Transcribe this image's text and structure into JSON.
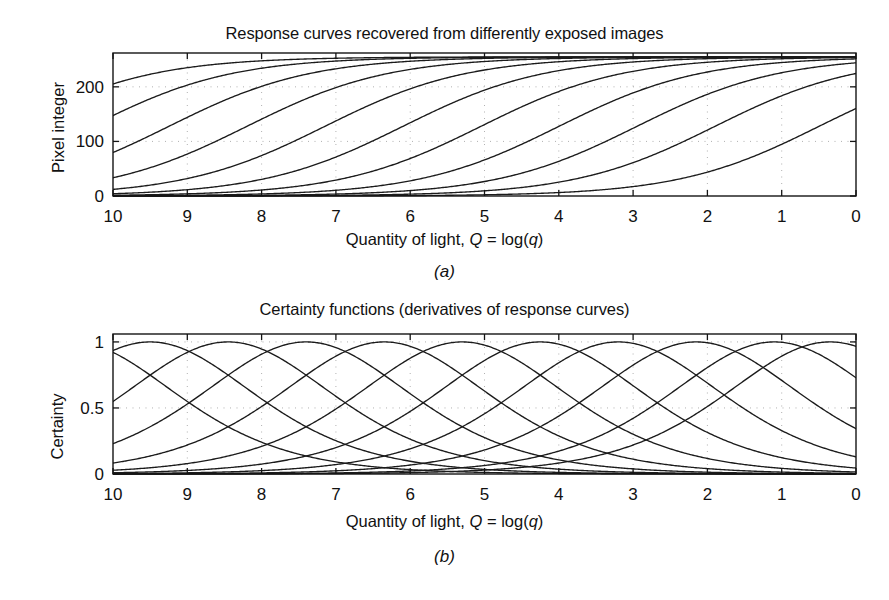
{
  "figure": {
    "caption_a": "(a)",
    "caption_b": "(b)"
  },
  "panel_a": {
    "title": "Response curves recovered from differently exposed images",
    "xlabel_prefix": "Quantity of light, ",
    "xlabel_var1": "Q",
    "xlabel_mid": " = log(",
    "xlabel_var2": "q",
    "xlabel_suffix": ")",
    "ylabel": "Pixel integer"
  },
  "panel_b": {
    "title": "Certainty functions (derivatives of response curves)",
    "xlabel_prefix": "Quantity of light, ",
    "xlabel_var1": "Q",
    "xlabel_mid": " = log(",
    "xlabel_var2": "q",
    "xlabel_suffix": ")",
    "ylabel": "Certainty"
  },
  "chart_data": [
    {
      "type": "line",
      "id": "response-curves",
      "title": "Response curves recovered from differently exposed images",
      "xlabel": "Quantity of light, Q = log(q)",
      "ylabel": "Pixel integer",
      "xlim": [
        10,
        0
      ],
      "ylim": [
        0,
        262
      ],
      "x_ticks": [
        10,
        9,
        8,
        7,
        6,
        5,
        4,
        3,
        2,
        1,
        0
      ],
      "y_ticks": [
        0,
        100,
        200
      ],
      "y_tick_labels": [
        "0",
        "100",
        "200"
      ],
      "x_reversed": true,
      "grid": "dotted",
      "legend": "none",
      "curve_count": 11,
      "curve_model": "f(Q) = 255 / (1 + exp(k*(Q - Q0)))",
      "curve_slope_k": 1.05,
      "curve_centers_Q0": [
        11.35,
        10.3,
        9.25,
        8.2,
        7.15,
        6.1,
        5.05,
        4.0,
        2.95,
        1.9,
        0.5
      ],
      "series": [
        {
          "name": "exposure-1",
          "center_Q": 11.35,
          "left_edge_value": 255,
          "right_edge_value": 255
        },
        {
          "name": "exposure-2",
          "center_Q": 10.3,
          "left_edge_value": 236,
          "right_edge_value": 255
        },
        {
          "name": "exposure-3",
          "center_Q": 9.25,
          "left_edge_value": 140,
          "right_edge_value": 255
        },
        {
          "name": "exposure-4",
          "center_Q": 8.2,
          "left_edge_value": 65,
          "right_edge_value": 255
        },
        {
          "name": "exposure-5",
          "center_Q": 7.15,
          "left_edge_value": 25,
          "right_edge_value": 255
        },
        {
          "name": "exposure-6",
          "center_Q": 6.1,
          "left_edge_value": 9,
          "right_edge_value": 255
        },
        {
          "name": "exposure-7",
          "center_Q": 5.05,
          "left_edge_value": 3,
          "right_edge_value": 254
        },
        {
          "name": "exposure-8",
          "center_Q": 4.0,
          "left_edge_value": 1,
          "right_edge_value": 251
        },
        {
          "name": "exposure-9",
          "center_Q": 2.95,
          "left_edge_value": 0,
          "right_edge_value": 240
        },
        {
          "name": "exposure-10",
          "center_Q": 1.9,
          "left_edge_value": 0,
          "right_edge_value": 218
        },
        {
          "name": "exposure-11",
          "center_Q": 0.5,
          "left_edge_value": 0,
          "right_edge_value": 237
        }
      ]
    },
    {
      "type": "line",
      "id": "certainty-functions",
      "title": "Certainty functions (derivatives of response curves)",
      "xlabel": "Quantity of light, Q = log(q)",
      "ylabel": "Certainty",
      "xlim": [
        10,
        0
      ],
      "ylim": [
        0,
        1.06
      ],
      "x_ticks": [
        10,
        9,
        8,
        7,
        6,
        5,
        4,
        3,
        2,
        1,
        0
      ],
      "y_ticks": [
        0,
        0.5,
        1
      ],
      "y_tick_labels": [
        "0",
        "0.5",
        "1"
      ],
      "x_reversed": true,
      "grid": "dotted",
      "legend": "none",
      "curve_count": 11,
      "curve_model": "g(Q) = sech^2( k*(Q - Q0) / 2 ), normalized to peak 1",
      "curve_slope_k": 1.05,
      "curve_centers_Q0": [
        10.55,
        9.5,
        8.45,
        7.4,
        6.35,
        5.3,
        4.25,
        3.2,
        2.15,
        1.1,
        0.35
      ],
      "series": [
        {
          "name": "certainty-1",
          "peak_Q": 10.55,
          "peak_value": 1.0,
          "left_edge_value": 0.82
        },
        {
          "name": "certainty-2",
          "peak_Q": 9.5,
          "peak_value": 1.0,
          "left_edge_value": 0.49
        },
        {
          "name": "certainty-3",
          "peak_Q": 8.45,
          "peak_value": 1.0,
          "left_edge_value": 0.24
        },
        {
          "name": "certainty-4",
          "peak_Q": 7.4,
          "peak_value": 1.0,
          "left_edge_value": 0.1
        },
        {
          "name": "certainty-5",
          "peak_Q": 6.35,
          "peak_value": 1.0,
          "left_edge_value": 0.04
        },
        {
          "name": "certainty-6",
          "peak_Q": 5.3,
          "peak_value": 1.0,
          "left_edge_value": 0.015
        },
        {
          "name": "certainty-7",
          "peak_Q": 4.25,
          "peak_value": 1.0,
          "left_edge_value": 0.005
        },
        {
          "name": "certainty-8",
          "peak_Q": 3.2,
          "peak_value": 1.0,
          "left_edge_value": 0.002
        },
        {
          "name": "certainty-9",
          "peak_Q": 2.15,
          "peak_value": 1.0,
          "left_edge_value": 0.0
        },
        {
          "name": "certainty-10",
          "peak_Q": 1.1,
          "peak_value": 1.0,
          "left_edge_value": 0.0
        },
        {
          "name": "certainty-11",
          "peak_Q": 0.35,
          "peak_value": 1.0,
          "left_edge_value": 0.0
        }
      ]
    }
  ],
  "geometry": {
    "panel_a_plot": {
      "left": 113,
      "right": 856,
      "top": 53,
      "bottom": 196
    },
    "panel_b_plot": {
      "left": 113,
      "right": 856,
      "top": 49,
      "bottom": 189
    }
  },
  "colors": {
    "curve": "#1b1b1b",
    "axis": "#141414",
    "grid": "#9a9a9a",
    "text": "#111111",
    "background": "#ffffff"
  }
}
